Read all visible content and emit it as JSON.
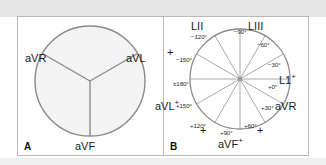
{
  "figure": {
    "background": "#ffffff",
    "band_color": "#e6e6e6",
    "stroke_color": "#8a8a8a",
    "sector_fill": "#f4f4f4",
    "border_color": "#b9b9b9"
  },
  "panel_a": {
    "letter": "A",
    "circle": {
      "fill": "#f4f4f4",
      "stroke": "#8a8a8a"
    },
    "sector_divider_angles_deg": [
      30,
      150,
      270
    ],
    "labels": [
      {
        "name": "avr",
        "text": "aVR",
        "x": 7,
        "y": 36
      },
      {
        "name": "avl",
        "text": "aVL",
        "x": 108,
        "y": 36
      },
      {
        "name": "avf",
        "text": "aVF",
        "x": 57,
        "y": 125
      }
    ]
  },
  "panel_b": {
    "letter": "B",
    "circle": {
      "fill": "#ffffff",
      "stroke": "#8a8a8a"
    },
    "spoke_angles_deg": [
      0,
      30,
      60,
      90,
      120,
      150,
      180,
      210,
      240,
      270,
      300,
      330
    ],
    "angle_ticks": [
      {
        "name": "angle-minus-120",
        "text": "−120°",
        "x": 27,
        "y": 17
      },
      {
        "name": "angle-minus-90",
        "text": "−90°",
        "x": 70,
        "y": 13
      },
      {
        "name": "angle-minus-60",
        "text": "−60°",
        "x": 93,
        "y": 25
      },
      {
        "name": "angle-minus-30",
        "text": "−30°",
        "x": 106,
        "y": 45
      },
      {
        "name": "angle-plus-0",
        "text": "+0°",
        "x": 106,
        "y": 68
      },
      {
        "name": "angle-plus-30",
        "text": "+30°",
        "x": 99,
        "y": 89
      },
      {
        "name": "angle-plus-60",
        "text": "+60°",
        "x": 82,
        "y": 108
      },
      {
        "name": "angle-plus-90",
        "text": "+90°",
        "x": 57,
        "y": 116
      },
      {
        "name": "angle-plus-120",
        "text": "+120°",
        "x": 27,
        "y": 108
      },
      {
        "name": "angle-plus-150",
        "text": "+150°",
        "x": 13,
        "y": 88
      },
      {
        "name": "angle-pm-180",
        "text": "±180°",
        "x": 10,
        "y": 65
      },
      {
        "name": "angle-minus-150",
        "text": "−150°",
        "x": 13,
        "y": 40
      }
    ],
    "lead_labels": [
      {
        "name": "lead-lii",
        "text": "LII",
        "sup": "",
        "x": 29,
        "y": 5
      },
      {
        "name": "lead-liii",
        "text": "LIII",
        "sup": "",
        "x": 85,
        "y": 5
      },
      {
        "name": "lead-l1",
        "text": "L1",
        "sup": "+",
        "x": 117,
        "y": 61
      },
      {
        "name": "lead-avr",
        "text": "aVR",
        "sup": "",
        "x": 113,
        "y": 87
      },
      {
        "name": "lead-avf",
        "text": "aVF",
        "sup": "+",
        "x": 55,
        "y": 125
      },
      {
        "name": "lead-avl",
        "text": "aVL",
        "sup": "+",
        "x": -8,
        "y": 87
      }
    ],
    "polarity_marks": [
      {
        "name": "plus-mark-upper-left",
        "x": 4,
        "y": 32
      },
      {
        "name": "plus-mark-lower-left",
        "x": 37,
        "y": 110
      },
      {
        "name": "plus-mark-lower-right",
        "x": 94,
        "y": 110
      }
    ]
  }
}
